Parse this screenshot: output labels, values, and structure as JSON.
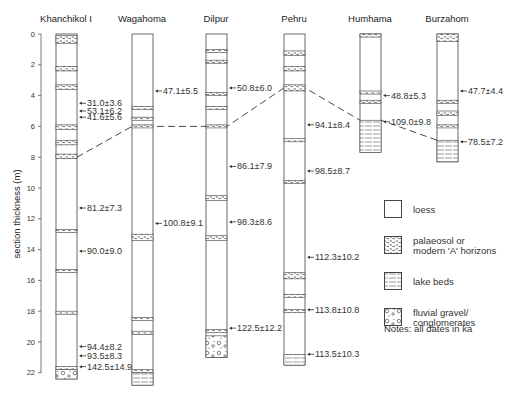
{
  "figure": {
    "y_axis_label": "section thickness (m)",
    "y_ticks": [
      "0",
      "2",
      "4",
      "6",
      "8",
      "10",
      "12",
      "14",
      "16",
      "18",
      "20",
      "22"
    ],
    "note": "Notes: all dates in ka"
  },
  "legend": {
    "items": [
      {
        "key": "loess",
        "label_1": "loess",
        "label_2": ""
      },
      {
        "key": "palaeosol",
        "label_1": "palaeosol or",
        "label_2": "modern 'A' horizons"
      },
      {
        "key": "lake",
        "label_1": "lake beds",
        "label_2": ""
      },
      {
        "key": "gravel",
        "label_1": "fluvial gravel/",
        "label_2": "conglomerates"
      }
    ]
  },
  "columns": [
    {
      "name": "Khanchikol I",
      "dates": [
        "31.0±3.6",
        "53.1±6.2",
        "41.6±5.6",
        "81.2±7.3",
        "90.0±9.0",
        "94.4±8.2",
        "93.5±8.3",
        "142.5±14.9"
      ]
    },
    {
      "name": "Wagahoma",
      "dates": [
        "47.1±5.5",
        "100.8±9.1"
      ]
    },
    {
      "name": "Dilpur",
      "dates": [
        "50.8±6.0",
        "86.1±7.9",
        "98.3±8.6",
        "122.5±12.2"
      ]
    },
    {
      "name": "Pehru",
      "dates": [
        "94.1±8.4",
        "98.5±8.7",
        "112.3±10.2",
        "113.8±10.8",
        "113.5±10.3"
      ]
    },
    {
      "name": "Humhama",
      "dates": [
        "48.8±5.3",
        "109.0±9.8"
      ]
    },
    {
      "name": "Burzahom",
      "dates": [
        "47.7±4.4",
        "78.5±7.2"
      ]
    }
  ],
  "chart_data": {
    "type": "stratigraphic-columns",
    "ylabel": "section thickness (m)",
    "ylim": [
      0,
      22
    ],
    "columns": [
      {
        "name": "Khanchikol I",
        "base_m": 22.4,
        "palaeosols_m": [
          [
            0.1,
            0.6
          ],
          [
            2.1,
            2.4
          ],
          [
            3.3,
            3.6
          ],
          [
            5.9,
            6.2
          ],
          [
            6.9,
            7.2
          ],
          [
            7.8,
            8.1
          ],
          [
            12.7,
            12.8
          ],
          [
            15.3,
            15.4
          ],
          [
            18.0,
            18.1
          ],
          [
            21.6,
            21.8
          ]
        ],
        "gravel_m": [
          [
            21.8,
            22.4
          ]
        ],
        "dates": [
          {
            "m": 4.5,
            "ka": "31.0±3.6"
          },
          {
            "m": 5.0,
            "ka": "53.1±6.2"
          },
          {
            "m": 5.4,
            "ka": "41.6±5.6"
          },
          {
            "m": 11.3,
            "ka": "81.2±7.3"
          },
          {
            "m": 14.1,
            "ka": "90.0±9.0"
          },
          {
            "m": 20.3,
            "ka": "94.4±8.2"
          },
          {
            "m": 20.9,
            "ka": "93.5±8.3"
          },
          {
            "m": 21.6,
            "ka": "142.5±14.9"
          }
        ]
      },
      {
        "name": "Wagahoma",
        "base_m": 22.8,
        "palaeosols_m": [
          [
            4.7,
            4.9
          ],
          [
            5.4,
            5.6
          ],
          [
            5.9,
            6.1
          ],
          [
            13.0,
            13.4
          ],
          [
            18.4,
            18.6
          ],
          [
            19.3,
            19.5
          ],
          [
            21.8,
            22.0
          ]
        ],
        "lake_m": [
          [
            22.0,
            22.8
          ]
        ],
        "dates": [
          {
            "m": 3.7,
            "ka": "47.1±5.5"
          },
          {
            "m": 12.3,
            "ka": "100.8±9.1"
          }
        ]
      },
      {
        "name": "Dilpur",
        "base_m": 21.0,
        "palaeosols_m": [
          [
            1.0,
            1.2
          ],
          [
            1.7,
            1.9
          ],
          [
            3.8,
            4.0
          ],
          [
            4.7,
            4.9
          ],
          [
            5.9,
            6.1
          ],
          [
            10.5,
            10.8
          ],
          [
            13.1,
            13.4
          ],
          [
            19.2,
            19.4
          ]
        ],
        "gravel_m": [
          [
            19.6,
            21.0
          ]
        ],
        "dates": [
          {
            "m": 3.5,
            "ka": "50.8±6.0"
          },
          {
            "m": 8.6,
            "ka": "86.1±7.9"
          },
          {
            "m": 12.2,
            "ka": "98.3±8.6"
          },
          {
            "m": 19.1,
            "ka": "122.5±12.2"
          }
        ]
      },
      {
        "name": "Pehru",
        "base_m": 21.5,
        "palaeosols_m": [
          [
            1.1,
            1.4
          ],
          [
            2.1,
            2.4
          ],
          [
            3.3,
            3.7
          ],
          [
            6.8,
            7.0
          ],
          [
            9.5,
            9.7
          ],
          [
            15.5,
            15.9
          ],
          [
            16.9,
            17.1
          ],
          [
            17.9,
            18.1
          ]
        ],
        "lake_m": [
          [
            20.8,
            21.5
          ]
        ],
        "dates": [
          {
            "m": 5.9,
            "ka": "94.1±8.4"
          },
          {
            "m": 8.9,
            "ka": "98.5±8.7"
          },
          {
            "m": 14.5,
            "ka": "112.3±10.2"
          },
          {
            "m": 17.9,
            "ka": "113.8±10.8"
          },
          {
            "m": 20.8,
            "ka": "113.5±10.3"
          }
        ]
      },
      {
        "name": "Humhama",
        "base_m": 7.7,
        "palaeosols_m": [
          [
            0.0,
            0.2
          ],
          [
            3.7,
            3.9
          ],
          [
            4.3,
            4.5
          ]
        ],
        "lake_m": [
          [
            5.6,
            7.7
          ]
        ],
        "dates": [
          {
            "m": 4.0,
            "ka": "48.8±5.3"
          },
          {
            "m": 5.7,
            "ka": "109.0±9.8"
          }
        ]
      },
      {
        "name": "Burzahom",
        "base_m": 8.3,
        "palaeosols_m": [
          [
            0.0,
            0.5
          ],
          [
            4.3,
            4.5
          ],
          [
            5.0,
            5.3
          ],
          [
            5.9,
            6.1
          ]
        ],
        "lake_m": [
          [
            6.9,
            8.3
          ]
        ],
        "dates": [
          {
            "m": 3.7,
            "ka": "47.7±4.4"
          },
          {
            "m": 7.0,
            "ka": "78.5±7.2"
          }
        ]
      }
    ],
    "correlation_line_m": [
      {
        "col": "Khanchikol I",
        "m": 8.0
      },
      {
        "col": "Wagahoma",
        "m": 6.0
      },
      {
        "col": "Dilpur",
        "m": 6.0
      },
      {
        "col": "Pehru",
        "m": 3.5
      },
      {
        "col": "Humhama",
        "m": 5.6
      },
      {
        "col": "Burzahom",
        "m": 6.9
      }
    ]
  }
}
